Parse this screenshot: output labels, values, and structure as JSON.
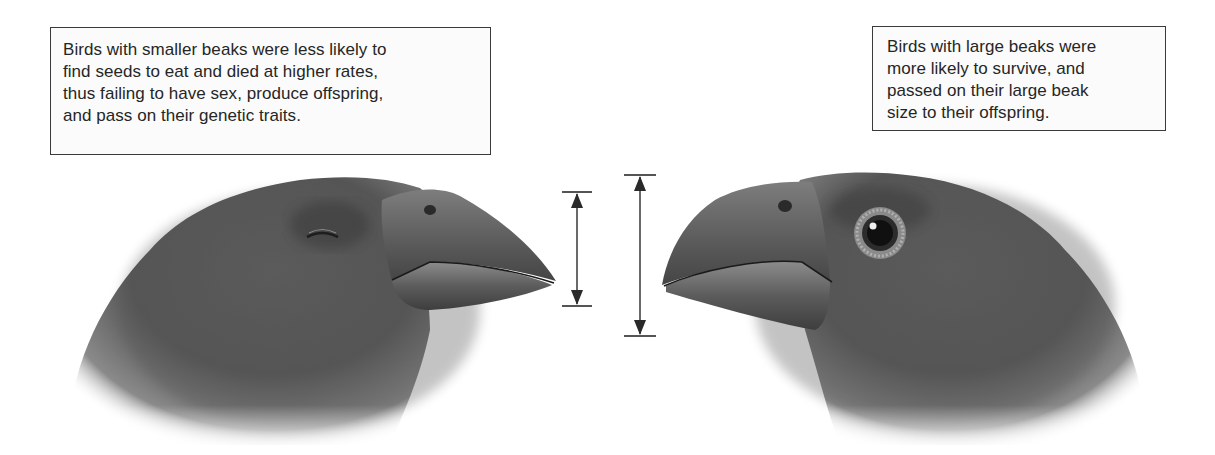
{
  "diagram": {
    "topic": "Natural selection on finch beak size",
    "captions": {
      "left": {
        "lines": [
          "Birds with smaller beaks were less likely to",
          "find seeds to eat and died at higher rates,",
          "thus failing to have sex, produce offspring,",
          "and pass on their genetic traits."
        ]
      },
      "right": {
        "lines": [
          "Birds with large beaks were",
          "more likely to survive, and",
          "passed on their large beak",
          "size to their offspring."
        ]
      }
    },
    "figures": {
      "left_bird": {
        "label": "small-beaked finch",
        "eye_state": "closed",
        "facing": "right"
      },
      "right_bird": {
        "label": "large-beaked finch",
        "eye_state": "open",
        "facing": "left"
      }
    },
    "measurements": {
      "small_beak_depth": {
        "x": 577,
        "top": 192,
        "bottom": 306
      },
      "large_beak_depth": {
        "x": 640,
        "top": 175,
        "bottom": 336
      }
    },
    "colors": {
      "border": "#3a3a3a",
      "text": "#262626",
      "feather_dark": "#3f3f3f",
      "feather_mid": "#6a6a6a",
      "beak": "#5a5a5a",
      "arrow": "#2a2a2a"
    }
  }
}
